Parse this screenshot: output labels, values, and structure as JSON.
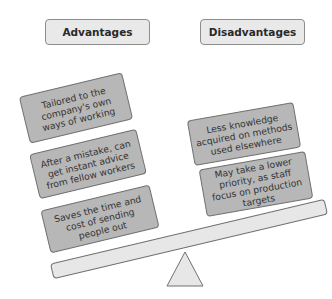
{
  "diagram": {
    "type": "balance-scale",
    "advantages": {
      "title": "Advantages",
      "items": [
        "Tailored to the company's own ways of working",
        "After a mistake, can get instant advice from fellow workers",
        "Saves the time and cost of sending people out"
      ]
    },
    "disadvantages": {
      "title": "Disadvantages",
      "items": [
        "Less knowledge acquired on methods used elsewhere",
        "May take a lower priority, as staff focus on production targets"
      ]
    },
    "colors": {
      "header_fill": "#e9e9e9",
      "card_fill": "#b7b7b7",
      "beam_fill": "#e7e7e7",
      "outline": "#707070"
    }
  }
}
